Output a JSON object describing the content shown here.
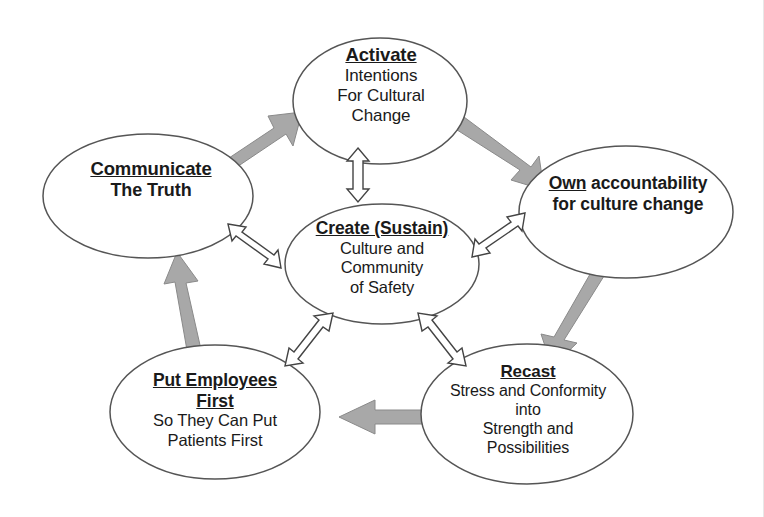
{
  "diagram": {
    "background_color": "#ffffff",
    "outline_color": "#555555",
    "solid_arrow_color": "#a9a9a9",
    "hollow_arrow_fill": "#ffffff",
    "hollow_arrow_stroke": "#444444",
    "text_color": "#1a1a1a"
  },
  "nodes": {
    "activate": {
      "heading": "Activate",
      "line1": "Intentions",
      "line2": "For Cultural",
      "line3": "Change"
    },
    "communicate": {
      "heading": "Communicate",
      "line1": "The Truth"
    },
    "own": {
      "heading": "Own",
      "heading_rest": " accountability",
      "line1": "for  culture change"
    },
    "create": {
      "heading": "Create (Sustain)",
      "line1": "Culture and",
      "line2": "Community",
      "line3": "of Safety"
    },
    "recast": {
      "heading": "Recast",
      "line1": "Stress and Conformity",
      "line2": "into",
      "line3": "Strength and",
      "line4": "Possibilities"
    },
    "employees": {
      "heading_line1": "Put Employees",
      "heading_line2": "First",
      "line1": "So They Can Put",
      "line2": "Patients First"
    }
  },
  "connectors": {
    "outer_cycle": [
      {
        "name": "communicate-to-activate",
        "style": "solid-gray",
        "direction": "one-way"
      },
      {
        "name": "activate-to-own",
        "style": "solid-gray",
        "direction": "one-way"
      },
      {
        "name": "own-to-recast",
        "style": "solid-gray",
        "direction": "one-way"
      },
      {
        "name": "recast-to-employees",
        "style": "solid-gray",
        "direction": "one-way"
      },
      {
        "name": "employees-to-communicate",
        "style": "solid-gray",
        "direction": "one-way"
      }
    ],
    "spokes": [
      {
        "name": "activate-create",
        "style": "hollow-outline",
        "direction": "two-way"
      },
      {
        "name": "communicate-create",
        "style": "hollow-outline",
        "direction": "two-way"
      },
      {
        "name": "own-create",
        "style": "hollow-outline",
        "direction": "two-way"
      },
      {
        "name": "employees-create",
        "style": "hollow-outline",
        "direction": "two-way"
      },
      {
        "name": "recast-create",
        "style": "hollow-outline",
        "direction": "two-way"
      }
    ]
  }
}
